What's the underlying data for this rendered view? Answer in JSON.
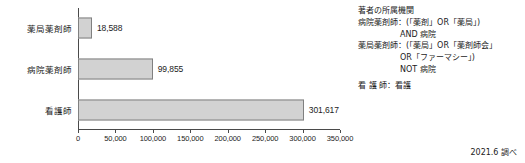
{
  "chart_data": {
    "type": "bar",
    "orientation": "horizontal",
    "title": "",
    "xlabel": "",
    "ylabel": "",
    "categories": [
      "薬局薬剤師",
      "病院薬剤師",
      "看護師"
    ],
    "values": [
      18588,
      99855,
      301617
    ],
    "value_labels": [
      "18,588",
      "99,855",
      "301,617"
    ],
    "xlim": [
      0,
      350000
    ],
    "xticks": [
      0,
      50000,
      100000,
      150000,
      200000,
      250000,
      300000,
      350000
    ],
    "xtick_labels": [
      "0",
      "50,000",
      "100,000",
      "150,000",
      "200,000",
      "250,000",
      "300,000",
      "350,000"
    ],
    "grid": false,
    "legend": null,
    "bar_fill_color": "#d2d2d2",
    "bar_border_color": "#808080",
    "axis_color": "#4a4a4a"
  },
  "note": {
    "heading": "著者の所属機関",
    "lines": [
      "病院薬剤師：(「薬剤」OR「薬局」)",
      "AND 病院",
      "薬局薬剤師：(「薬局」OR「薬剤師会」",
      "OR「ファーマシー」)",
      "NOT 病院",
      "看 護 師：看護"
    ]
  },
  "footnote": "2021.6 調べ"
}
